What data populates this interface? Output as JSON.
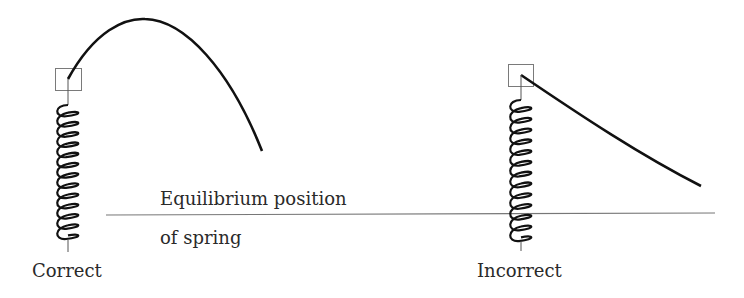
{
  "labels": {
    "equilibrium_line1": "Equilibrium position",
    "equilibrium_line2": "of spring",
    "correct": "Correct",
    "incorrect": "Incorrect"
  },
  "colors": {
    "stroke": "#111111",
    "box": "#7a7a7a",
    "line": "#777777",
    "text": "#2a2a2a"
  },
  "diagrams": [
    {
      "name": "correct",
      "caption": "Correct",
      "trajectory": "parabolic arc (rises then falls)"
    },
    {
      "name": "incorrect",
      "caption": "Incorrect",
      "trajectory": "decaying curve (falls immediately)"
    }
  ]
}
